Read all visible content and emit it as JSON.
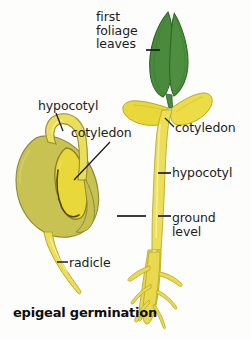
{
  "figure": {
    "caption": "epigeal germination",
    "background_color": "#fdfdfb",
    "text_color": "#1c1c1c"
  },
  "palette": {
    "leaf_green": "#4a8a3c",
    "leaf_green_dark": "#2f6b28",
    "leaf_green_light": "#6aa84f",
    "cotyledon_yellow": "#e8d83a",
    "cotyledon_yellow_light": "#f2e87a",
    "seed_coat_olive": "#c8c253",
    "seed_coat_olive_dark": "#a8a23f",
    "stem_yellow": "#ecdf57",
    "stem_yellow_pale": "#f5ef9a",
    "root_yellow": "#ead94e",
    "outline_dark": "#5c5418",
    "leader_line": "#1c1c1c"
  },
  "labels": [
    {
      "id": "first-foliage-leaves",
      "text": "first\nfoliage\nleaves",
      "points_to": "green-leaves"
    },
    {
      "id": "hypocotyl-left",
      "text": "hypocotyl",
      "points_to": "seed-hook"
    },
    {
      "id": "cotyledon-left",
      "text": "cotyledon",
      "points_to": "seed-inner-cotyledon"
    },
    {
      "id": "cotyledon-right",
      "text": "cotyledon",
      "points_to": "seedling-cotyledon"
    },
    {
      "id": "hypocotyl-right",
      "text": "hypocotyl",
      "points_to": "seedling-stem"
    },
    {
      "id": "ground-level",
      "text": "ground\nlevel",
      "points_to": "ground-line"
    },
    {
      "id": "radicle",
      "text": "radicle",
      "points_to": "seed-radicle"
    }
  ],
  "structures": [
    {
      "id": "green-leaves",
      "name": "first foliage leaves",
      "count": 2,
      "color": "#4a8a3c"
    },
    {
      "id": "seedling-cotyledon",
      "name": "cotyledons of seedling",
      "count": 2,
      "color": "#e8d83a"
    },
    {
      "id": "seedling-stem",
      "name": "hypocotyl stem",
      "color": "#ecdf57"
    },
    {
      "id": "seedling-root",
      "name": "root system with laterals",
      "color": "#ead94e"
    },
    {
      "id": "seed",
      "name": "germinating seed with seed coat",
      "color": "#c8c253"
    },
    {
      "id": "seed-hook",
      "name": "hypocotyl arch",
      "color": "#e8d83a"
    },
    {
      "id": "seed-radicle",
      "name": "radicle emerging from seed",
      "color": "#ecdf57"
    }
  ]
}
